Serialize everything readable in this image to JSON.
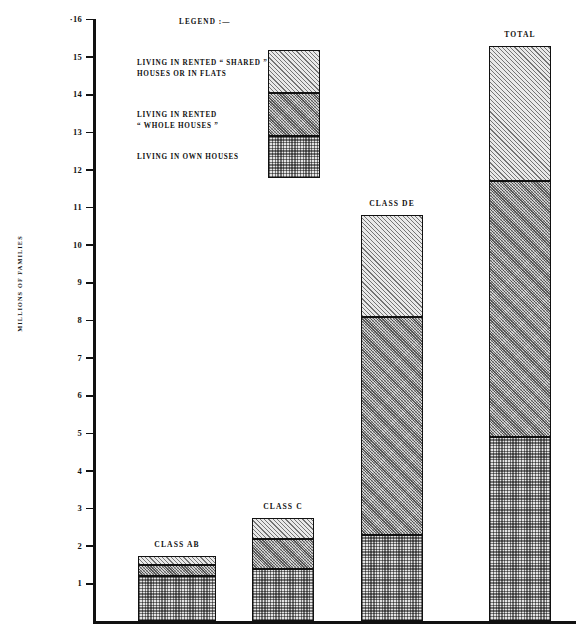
{
  "chart_data": {
    "type": "bar",
    "title": "",
    "xlabel": "",
    "ylabel": "MILLIONS OF FAMILIES",
    "ylim": [
      0,
      16
    ],
    "ytick_labels": [
      "·16",
      "15",
      "14",
      "13",
      "12",
      "11",
      "10",
      "9",
      "8",
      "7",
      "6",
      "5",
      "4",
      "3",
      "2",
      "1"
    ],
    "ytick_values": [
      16,
      15,
      14,
      13,
      12,
      11,
      10,
      9,
      8,
      7,
      6,
      5,
      4,
      3,
      2,
      1
    ],
    "grid": false,
    "stacked": true,
    "categories": [
      "CLASS AB",
      "CLASS C",
      "CLASS DE",
      "TOTAL"
    ],
    "series": [
      {
        "name": "LIVING IN OWN HOUSES",
        "pattern": "checkerboard",
        "values": [
          1.2,
          1.4,
          2.3,
          4.9
        ]
      },
      {
        "name": "LIVING IN RENTED “ WHOLE HOUSES ”",
        "pattern": "dense-diagonal-hatch",
        "values": [
          0.3,
          0.8,
          5.8,
          6.8
        ]
      },
      {
        "name": "LIVING IN RENTED “ SHARED ” HOUSES OR IN FLATS",
        "pattern": "light-diagonal-hatch",
        "values": [
          0.25,
          0.55,
          2.7,
          3.6
        ]
      }
    ],
    "stack_tops": {
      "CLASS AB": [
        1.2,
        1.5,
        1.75
      ],
      "CLASS C": [
        1.4,
        2.2,
        2.75
      ],
      "CLASS DE": [
        2.3,
        8.1,
        10.8
      ],
      "TOTAL": [
        4.9,
        11.7,
        15.3
      ]
    },
    "totals": [
      1.75,
      2.75,
      10.8,
      15.3
    ]
  },
  "legend": {
    "title": "LEGEND :—",
    "entries": [
      {
        "line1": "LIVING IN RENTED “ SHARED ”",
        "line2": "HOUSES OR IN FLATS",
        "pattern": "light-diagonal-hatch"
      },
      {
        "line1": "LIVING IN RENTED",
        "line2": "“ WHOLE HOUSES ”",
        "pattern": "dense-diagonal-hatch"
      },
      {
        "line1": "LIVING IN OWN HOUSES",
        "line2": "",
        "pattern": "checkerboard"
      }
    ]
  },
  "bar_labels": {
    "ab": "CLASS AB",
    "c": "CLASS C",
    "de": "CLASS DE",
    "total": "TOTAL"
  },
  "axis": {
    "y_title": "MILLIONS OF FAMILIES"
  }
}
